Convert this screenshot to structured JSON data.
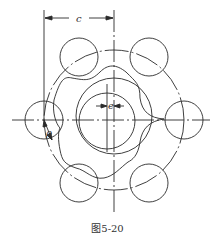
{
  "figure": {
    "caption": "图5-20",
    "labels": {
      "c": "c",
      "e": "e",
      "rho": "ρ"
    }
  },
  "geometry": {
    "center": [
      114,
      120
    ],
    "pitch_circle_radius": 70,
    "roller_radius": 19,
    "roller_count": 6,
    "eccentricity_offset": 7,
    "cam_outer_radius": 38,
    "cam_inner_radius": 28
  },
  "colors": {
    "line": "#2a2a2a",
    "background": "#ffffff"
  }
}
